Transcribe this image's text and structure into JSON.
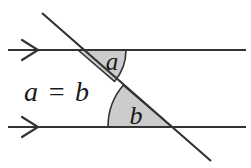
{
  "figure": {
    "background_color": "#ffffff",
    "stroke_color": "#333333",
    "shade_color": "#cccccc",
    "text_color": "#1a1a1a"
  },
  "equation": {
    "text": "a = b"
  },
  "angles": [
    {
      "id": "angle-a",
      "label": "a",
      "vertex": [
        78,
        50
      ],
      "radius": 48,
      "position": "upper-intersection-right"
    },
    {
      "id": "angle-b",
      "label": "b",
      "vertex": [
        172,
        127
      ],
      "radius": 64,
      "position": "lower-intersection-left"
    }
  ],
  "lines": [
    {
      "id": "top-parallel-line",
      "label": "top parallel line",
      "from": [
        8,
        50
      ],
      "to": [
        246,
        50
      ],
      "marker": "single-chevron-arrow",
      "marker_x": 30
    },
    {
      "id": "bottom-parallel-line",
      "label": "bottom parallel line",
      "from": [
        8,
        127
      ],
      "to": [
        246,
        127
      ],
      "marker": "single-chevron-arrow",
      "marker_x": 30
    },
    {
      "id": "transversal-line",
      "label": "transversal",
      "from": [
        42,
        13
      ],
      "to": [
        211,
        161
      ],
      "marker": "none",
      "marker_x": 0
    }
  ]
}
